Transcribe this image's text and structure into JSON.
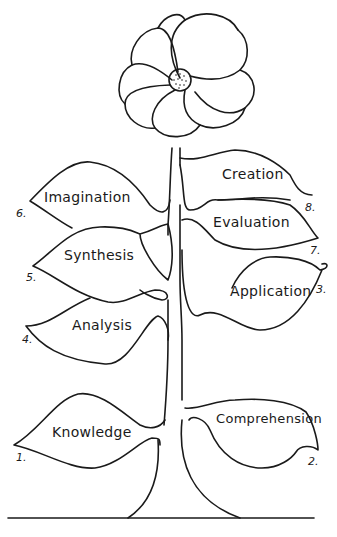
{
  "diagram": {
    "title_visible": false,
    "type": "flower-taxonomy",
    "colors": {
      "ink": "#1a1a1a",
      "background": "#ffffff"
    },
    "flower": {
      "petal_count": 9,
      "center": "dotted-seed-disc"
    },
    "leaves": [
      {
        "number": "1.",
        "label": "Knowledge",
        "side": "left"
      },
      {
        "number": "2.",
        "label": "Comprehension",
        "side": "right"
      },
      {
        "number": "3.",
        "label": "Application",
        "side": "right"
      },
      {
        "number": "4.",
        "label": "Analysis",
        "side": "left"
      },
      {
        "number": "5.",
        "label": "Synthesis",
        "side": "left"
      },
      {
        "number": "6.",
        "label": "Imagination",
        "side": "left"
      },
      {
        "number": "7.",
        "label": "Evaluation",
        "side": "right"
      },
      {
        "number": "8.",
        "label": "Creation",
        "side": "right"
      }
    ]
  }
}
